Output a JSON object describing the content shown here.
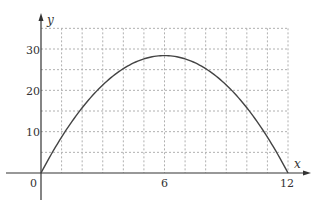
{
  "chart_data": {
    "type": "line",
    "title": "",
    "xlabel": "x",
    "ylabel": "y",
    "xlim": [
      0,
      12
    ],
    "ylim": [
      0,
      35
    ],
    "x_ticks": [
      "0",
      "6",
      "12"
    ],
    "y_ticks": [
      "10",
      "20",
      "30"
    ],
    "grid": true,
    "grid_x_step": 1,
    "grid_y_step": 5,
    "legend": null,
    "series": [
      {
        "name": "y",
        "x": [
          0,
          1,
          2,
          3,
          4,
          5,
          6,
          7,
          8,
          9,
          10,
          11,
          12
        ],
        "values": [
          0,
          8.7,
          15.8,
          21.3,
          25.3,
          27.7,
          28.4,
          27.7,
          25.3,
          21.3,
          15.8,
          8.7,
          0
        ]
      }
    ]
  },
  "labels": {
    "origin": "0",
    "x_axis": "x",
    "y_axis": "y",
    "x_tick_6": "6",
    "x_tick_12": "12",
    "y_tick_10": "10",
    "y_tick_20": "20",
    "y_tick_30": "30"
  }
}
